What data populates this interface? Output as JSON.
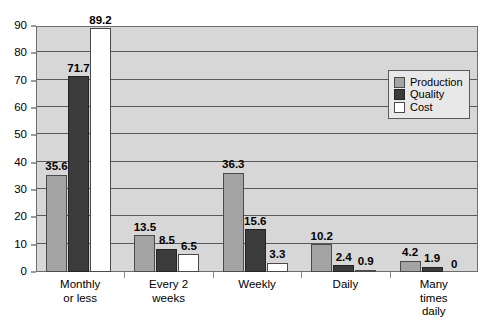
{
  "chart_data": {
    "type": "bar",
    "title": "",
    "subtitle": "",
    "xlabel": "",
    "ylabel": "",
    "ylim": [
      0,
      90
    ],
    "ytick_step": 10,
    "yticks": [
      0,
      10,
      20,
      30,
      40,
      50,
      60,
      70,
      80,
      90
    ],
    "grid": true,
    "grid_axis": "y",
    "legend_position": "upper right",
    "categories": [
      "Monthly\nor less",
      "Every 2\nweeks",
      "Weekly",
      "Daily",
      "Many\ntimes\ndaily"
    ],
    "series": [
      {
        "name": "Production",
        "color": "#a3a3a3",
        "values": [
          35.6,
          13.5,
          36.3,
          10.2,
          4.2
        ]
      },
      {
        "name": "Quality",
        "color": "#3b3b3b",
        "values": [
          71.7,
          8.5,
          15.6,
          2.4,
          1.9
        ]
      },
      {
        "name": "Cost",
        "color": "#ffffff",
        "values": [
          89.2,
          6.5,
          3.3,
          0.9,
          0
        ]
      }
    ],
    "value_labels": [
      [
        "35.6",
        "71.7",
        "89.2"
      ],
      [
        "13.5",
        "8.5",
        "6.5"
      ],
      [
        "36.3",
        "15.6",
        "3.3"
      ],
      [
        "10.2",
        "2.4",
        "0.9"
      ],
      [
        "4.2",
        "1.9",
        "0"
      ]
    ]
  },
  "legend": {
    "entries": [
      {
        "label": "Production",
        "swatch": "production-swatch"
      },
      {
        "label": "Quality",
        "swatch": "quality-swatch"
      },
      {
        "label": "Cost",
        "swatch": "cost-swatch"
      }
    ]
  },
  "axis": {
    "y_tick_labels": [
      "90",
      "80",
      "70",
      "60",
      "50",
      "40",
      "30",
      "20",
      "10",
      "0"
    ]
  },
  "colors": {
    "plot_background": "#d7d7d7",
    "gridline": "#595959",
    "frame": "#6e6e6e",
    "production": "#a3a3a3",
    "quality": "#3b3b3b",
    "cost": "#ffffff",
    "page_background": "#ffffff"
  }
}
